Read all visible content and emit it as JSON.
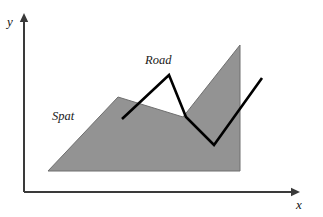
{
  "figure": {
    "title": "",
    "width": 323,
    "height": 217,
    "background_color": "#ffffff"
  },
  "axes": {
    "x_label": "x",
    "y_label": "y",
    "axis_color": "#3a3a3a",
    "x_axis": {
      "x1": 24,
      "y1": 192,
      "x2": 300,
      "y2": 192
    },
    "y_axis": {
      "x1": 24,
      "y1": 192,
      "x2": 24,
      "y2": 13
    },
    "x_label_pos": {
      "x": 299,
      "y": 209
    },
    "y_label_pos": {
      "x": 10,
      "y": 26
    }
  },
  "labels": {
    "region_label": "Spat",
    "region_label_pos": {
      "x": 52,
      "y": 120
    },
    "road_label": "Road",
    "road_label_pos": {
      "x": 145,
      "y": 64
    }
  },
  "chart_data": {
    "type": "area",
    "title": "",
    "xlabel": "x",
    "ylabel": "y",
    "grid": false,
    "legend": false,
    "series": [
      {
        "name": "Spat",
        "kind": "filled-polygon",
        "fill_color": "#939393",
        "stroke_color": "#6f6f6f",
        "points": [
          [
            48,
            171
          ],
          [
            118,
            97
          ],
          [
            183,
            117
          ],
          [
            240,
            45
          ],
          [
            240,
            171
          ]
        ]
      },
      {
        "name": "Road",
        "kind": "polyline",
        "stroke_color": "#000000",
        "stroke_width": 2.6,
        "points": [
          [
            122,
            119
          ],
          [
            169,
            75
          ],
          [
            186,
            117
          ],
          [
            214,
            145
          ],
          [
            262,
            78
          ]
        ]
      }
    ]
  },
  "colors": {
    "spat_fill": "#939393",
    "spat_stroke": "#6f6f6f",
    "road_stroke": "#000000",
    "axis": "#3a3a3a",
    "text": "#111111"
  }
}
